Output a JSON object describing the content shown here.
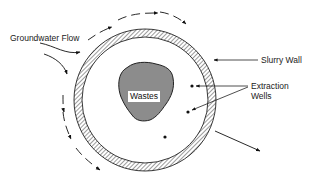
{
  "diagram": {
    "labels": {
      "groundwater_flow": "Groundwater Flow",
      "slurry_wall": "Slurry Wall",
      "extraction_wells_line1": "Extraction",
      "extraction_wells_line2": "Wells",
      "wastes": "Wastes"
    },
    "colors": {
      "line": "#1a1a1a",
      "waste_fill": "#8c8c8c",
      "background": "#ffffff"
    },
    "wells_count": 3
  }
}
